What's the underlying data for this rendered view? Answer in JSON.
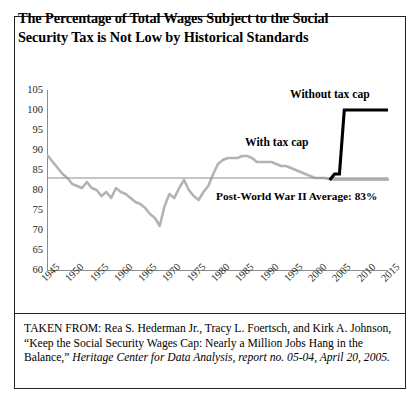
{
  "figure": {
    "title": "The Percentage of Total Wages Subject to the Social Security Tax is Not Low by Historical Standards",
    "source_prefix": "TAKEN FROM:",
    "source_authors": "Rea S. Hederman Jr., Tracy L. Foertsch, and Kirk A. Johnson,",
    "source_article": "“Keep the Social Security Wages Cap: Nearly a Million Jobs Hang in the Balance,”",
    "source_publication": "Heritage Center for Data Analysis, report no. 05-04",
    "source_date": ", April 20, 2005."
  },
  "chart_data": {
    "type": "line",
    "title": "The Percentage of Total Wages Subject to the Social Security Tax is Not Low by Historical Standards",
    "xlabel": "",
    "ylabel": "",
    "xlim": [
      1945,
      2015
    ],
    "ylim": [
      60,
      105
    ],
    "grid": false,
    "legend": "annotations",
    "yticks": [
      60,
      65,
      70,
      75,
      80,
      85,
      90,
      95,
      100,
      105
    ],
    "xticks": [
      1945,
      1950,
      1955,
      1960,
      1965,
      1970,
      1975,
      1980,
      1985,
      1990,
      1995,
      2000,
      2005,
      2010,
      2015
    ],
    "annotations": [
      {
        "name": "without-tax-cap",
        "text": "Without tax cap",
        "x": 2006,
        "y": 101
      },
      {
        "name": "with-tax-cap",
        "text": "With tax cap",
        "x": 1998,
        "y": 90
      },
      {
        "name": "postwar-average",
        "text": "Post-World War II Average: 83%",
        "x": 1990,
        "y": 80
      }
    ],
    "reference_line": {
      "name": "post-world-war-ii-average",
      "label": "Post-World War II Average: 83%",
      "value": 83,
      "color": "#8c8c8c"
    },
    "series": [
      {
        "name": "With tax cap",
        "color": "#b3b3b3",
        "x": [
          1945,
          1946,
          1947,
          1948,
          1949,
          1950,
          1951,
          1952,
          1953,
          1954,
          1955,
          1956,
          1957,
          1958,
          1959,
          1960,
          1961,
          1962,
          1963,
          1964,
          1965,
          1966,
          1967,
          1968,
          1969,
          1970,
          1971,
          1972,
          1973,
          1974,
          1975,
          1976,
          1977,
          1978,
          1979,
          1980,
          1981,
          1982,
          1983,
          1984,
          1985,
          1986,
          1987,
          1988,
          1989,
          1990,
          1991,
          1992,
          1993,
          1994,
          1995,
          1996,
          1997,
          1998,
          1999,
          2000,
          2001,
          2002,
          2003,
          2004,
          2005,
          2006,
          2007,
          2008,
          2009,
          2010,
          2011,
          2012,
          2013,
          2014,
          2015
        ],
        "values": [
          88.5,
          87.0,
          85.5,
          84.0,
          83.0,
          81.5,
          81.0,
          80.5,
          82.0,
          80.5,
          80.0,
          78.5,
          79.5,
          78.0,
          80.5,
          79.5,
          79.0,
          78.0,
          77.0,
          76.5,
          75.5,
          74.0,
          73.0,
          71.0,
          76.0,
          79.0,
          78.0,
          80.5,
          82.5,
          80.0,
          78.5,
          77.5,
          79.5,
          81.0,
          84.0,
          86.5,
          87.5,
          88.0,
          88.0,
          88.0,
          88.5,
          88.5,
          88.0,
          87.0,
          87.0,
          87.0,
          87.0,
          86.5,
          86.0,
          86.0,
          85.5,
          85.0,
          84.5,
          84.0,
          83.5,
          83.0,
          83.0,
          83.0,
          82.7,
          82.6,
          82.6,
          82.6,
          82.6,
          82.6,
          82.6,
          82.6,
          82.6,
          82.6,
          82.6,
          82.6,
          82.6
        ]
      },
      {
        "name": "Without tax cap",
        "color": "#000000",
        "x": [
          2003,
          2004,
          2005,
          2006,
          2015
        ],
        "values": [
          82.5,
          84.0,
          84.0,
          100.0,
          100.0
        ]
      }
    ]
  },
  "axes": {
    "y_ticks": [
      "105",
      "100",
      "95",
      "90",
      "85",
      "80",
      "75",
      "70",
      "65",
      "60"
    ],
    "x_ticks": [
      "1945",
      "1950",
      "1955",
      "1960",
      "1965",
      "1970",
      "1975",
      "1980",
      "1985",
      "1990",
      "1995",
      "2000",
      "2005",
      "2010",
      "2015"
    ]
  },
  "colors": {
    "with_tax_cap": "#b3b3b3",
    "without_tax_cap": "#000000",
    "axis": "#8c8c8c",
    "reference_line": "#8c8c8c",
    "border": "#231f20"
  }
}
